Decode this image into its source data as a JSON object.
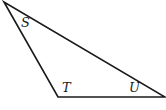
{
  "diagram": {
    "type": "triangle",
    "stroke_color": "#1a1a1a",
    "vertices": {
      "top": {
        "x": 4,
        "y": 2
      },
      "bottom_left": {
        "x": 58,
        "y": 97
      },
      "bottom_right": {
        "x": 165,
        "y": 97
      }
    },
    "angle_labels": {
      "S": "S",
      "T": "T",
      "U": "U"
    }
  }
}
